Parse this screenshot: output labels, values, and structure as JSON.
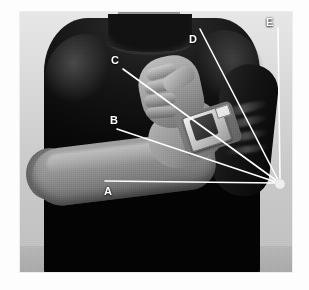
{
  "figure": {
    "kind": "annotated-photograph",
    "subject_description": "Torso of a person in a dark t-shirt with one forearm raised across the chest, wearing a device on the wrist",
    "photo": {
      "left": 20,
      "top": 12,
      "width": 272,
      "height": 260,
      "background_color": "#d6d6d6",
      "shirt_color": "#131211",
      "skin_color": "#a2927f",
      "floor_color": "#ababab"
    }
  },
  "annotation": {
    "line_color": "#ffffff",
    "label_color": "#ffffff",
    "vertex": {
      "name": "pivot-point",
      "x": 280,
      "y": 184,
      "radius": 5,
      "color": "#efefef"
    },
    "lines": [
      {
        "id": "A",
        "label": "A",
        "x1": 105,
        "y1": 181,
        "x2": 276,
        "y2": 183,
        "label_x": 104,
        "label_y": 186
      },
      {
        "id": "B",
        "label": "B",
        "x1": 117,
        "y1": 129,
        "x2": 276,
        "y2": 182,
        "label_x": 110,
        "label_y": 115
      },
      {
        "id": "C",
        "label": "C",
        "x1": 123,
        "y1": 69,
        "x2": 277,
        "y2": 181,
        "label_x": 111,
        "label_y": 55
      },
      {
        "id": "D",
        "label": "D",
        "x1": 200,
        "y1": 29,
        "x2": 278,
        "y2": 180,
        "label_x": 189,
        "label_y": 34
      },
      {
        "id": "E",
        "label": "E",
        "x1": 278,
        "y1": 28,
        "x2": 280,
        "y2": 179,
        "label_x": 266,
        "label_y": 17
      }
    ]
  }
}
